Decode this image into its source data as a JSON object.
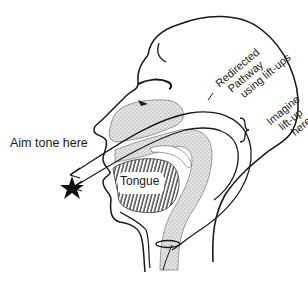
{
  "diagram": {
    "labels": {
      "aim": "Aim tone here",
      "tongue": "Tongue",
      "redirected": [
        "Redirected",
        "Pathway",
        "using lift-ups"
      ],
      "imagine": [
        "Imagine",
        "lift-up",
        "here"
      ]
    },
    "elements": {
      "head_outline": "profile head outline",
      "nasal_cavity": "stippled soft palate / nasal region",
      "pharynx": "stippled throat column",
      "tongue_shape": "hatched tongue",
      "pathway_arrows": 2,
      "target_marker": "black star"
    },
    "colors": {
      "line": "#1a1a1a",
      "stipple": "#b8b8b8",
      "background": "#ffffff"
    }
  }
}
